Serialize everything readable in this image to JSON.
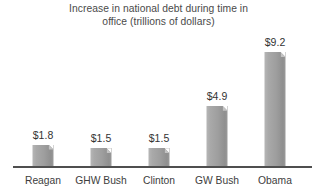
{
  "chart_data": {
    "type": "bar",
    "title": "Increase in national debt during time in\noffice (trillions of dollars)",
    "xlabel": "",
    "ylabel": "",
    "unit": "trillions of dollars",
    "grid": false,
    "legend": "none",
    "ylim": [
      0,
      9.2
    ],
    "categories": [
      "Reagan",
      "GHW Bush",
      "Clinton",
      "GW Bush",
      "Obama"
    ],
    "values": [
      1.8,
      1.5,
      1.5,
      4.9,
      9.2
    ],
    "value_labels": [
      "$1.8",
      "$1.5",
      "$1.5",
      "$4.9",
      "$9.2"
    ],
    "colors": {
      "bar_light": "#b6b6b6",
      "bar_dark": "#8f8f8f",
      "axis": "#4f4f4f",
      "title_text": "#4a4a4a",
      "label_text": "#3d3d3d",
      "value_text": "#333333",
      "background": "#ffffff"
    }
  }
}
